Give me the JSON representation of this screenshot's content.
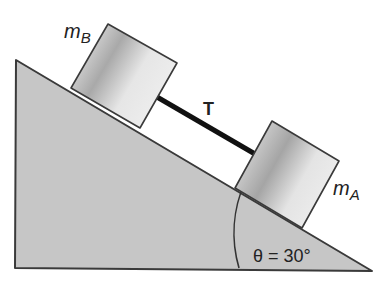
{
  "diagram": {
    "type": "physics-incline",
    "labels": {
      "block_b": "m",
      "block_b_sub": "B",
      "block_a": "m",
      "block_a_sub": "A",
      "tension": "T",
      "angle": "θ = 30°"
    },
    "angle_deg": 30,
    "colors": {
      "incline_fill": "#c4c4c4",
      "outline": "#3a3a3a",
      "block_light": "#e8e8e8",
      "block_dark": "#a8a8a8",
      "rope": "#111111"
    }
  }
}
